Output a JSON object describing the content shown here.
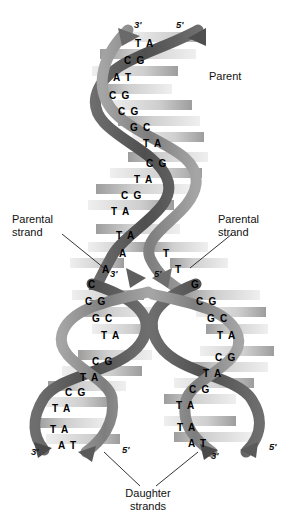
{
  "figure": {
    "colors": {
      "background": "#ffffff",
      "backbone_dark": "#595959",
      "backbone_mid": "#8c8c8c",
      "backbone_light": "#b3b3b3",
      "rung_light": "#e8e8e8",
      "rung_mid": "#a8a8a8",
      "text": "#111111"
    }
  },
  "labels": {
    "parent": "Parent",
    "parental_strand_left": "Parental\nstrand",
    "parental_strand_left_line1": "Parental",
    "parental_strand_left_line2": "strand",
    "parental_strand_right_line1": "Parental",
    "parental_strand_right_line2": "strand",
    "daughter_strands_line1": "Daughter",
    "daughter_strands_line2": "strands"
  },
  "polarity": {
    "top_left": "3'",
    "top_right": "5'",
    "fork_left": "3'",
    "fork_right": "5'",
    "bottom_left_outer": "3'",
    "bottom_left_inner": "5'",
    "bottom_right_inner": "3'",
    "bottom_right_outer": "5'"
  },
  "chart_data": {
    "type": "diagram",
    "parent_helix_base_pairs": [
      "TA",
      "CG",
      "AT",
      "CG",
      "CG",
      "GC",
      "TA",
      "CG",
      "TA",
      "CG",
      "TA",
      "TA"
    ],
    "fork_split_pair": {
      "left_base": "A",
      "right_base": "T"
    },
    "fork_split_pair_lower": {
      "left_bases": "A C",
      "right_base": "T"
    },
    "left_daughter_base_pairs": [
      "CG",
      "GC",
      "TA",
      "CG",
      "TA",
      "CG",
      "TA",
      "TA",
      "AT"
    ],
    "right_daughter_base_pairs": [
      "G",
      "CG",
      "GC",
      "TA",
      "CG",
      "TA",
      "CG",
      "TA",
      "TA",
      "AT"
    ],
    "annotations": [
      "Parent",
      "Parental strand",
      "Parental strand",
      "Daughter strands",
      "3'",
      "5'",
      "3'",
      "5'",
      "3'",
      "5'",
      "3'",
      "5'"
    ]
  },
  "base_pairs": {
    "parent": [
      {
        "text": "T A",
        "x": 135,
        "y": 38
      },
      {
        "text": "C G",
        "x": 124,
        "y": 55
      },
      {
        "text": "A T",
        "x": 113,
        "y": 72
      },
      {
        "text": "C G",
        "x": 109,
        "y": 90
      },
      {
        "text": "C G",
        "x": 118,
        "y": 106
      },
      {
        "text": "G C",
        "x": 130,
        "y": 122
      },
      {
        "text": "T A",
        "x": 143,
        "y": 138
      },
      {
        "text": "C G",
        "x": 146,
        "y": 158
      },
      {
        "text": "T A",
        "x": 134,
        "y": 174
      },
      {
        "text": "C G",
        "x": 121,
        "y": 190
      },
      {
        "text": "T A",
        "x": 111,
        "y": 206
      },
      {
        "text": "T A",
        "x": 116,
        "y": 230
      }
    ],
    "fork": [
      {
        "text": "A",
        "x": 119,
        "y": 248
      },
      {
        "text": "T",
        "x": 163,
        "y": 248
      },
      {
        "text": "A",
        "x": 102,
        "y": 264
      },
      {
        "text": "T",
        "x": 175,
        "y": 264
      },
      {
        "text": "C",
        "x": 88,
        "y": 279
      },
      {
        "text": "G",
        "x": 191,
        "y": 279
      }
    ],
    "left_daughter": [
      {
        "text": "C G",
        "x": 85,
        "y": 296
      },
      {
        "text": "G C",
        "x": 92,
        "y": 313
      },
      {
        "text": "T A",
        "x": 101,
        "y": 330
      },
      {
        "text": "C G",
        "x": 92,
        "y": 356
      },
      {
        "text": "T A",
        "x": 80,
        "y": 372
      },
      {
        "text": "C G",
        "x": 65,
        "y": 387
      },
      {
        "text": "T A",
        "x": 52,
        "y": 403
      },
      {
        "text": "T A",
        "x": 50,
        "y": 424
      },
      {
        "text": "A T",
        "x": 58,
        "y": 440
      }
    ],
    "right_daughter": [
      {
        "text": "C G",
        "x": 196,
        "y": 296
      },
      {
        "text": "G C",
        "x": 207,
        "y": 313
      },
      {
        "text": "T A",
        "x": 217,
        "y": 330
      },
      {
        "text": "C G",
        "x": 215,
        "y": 352
      },
      {
        "text": "T A",
        "x": 203,
        "y": 368
      },
      {
        "text": "C G",
        "x": 189,
        "y": 384
      },
      {
        "text": "T A",
        "x": 176,
        "y": 400
      },
      {
        "text": "T A",
        "x": 177,
        "y": 422
      },
      {
        "text": "A T",
        "x": 188,
        "y": 438
      }
    ]
  }
}
